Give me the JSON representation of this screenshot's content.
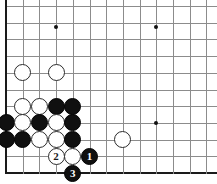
{
  "diagram": {
    "board_size": 19,
    "visible_region": "top-left corner",
    "grid": {
      "origin_x": 6,
      "origin_y": 6,
      "spacing": 16.7,
      "cols_visible": 13,
      "rows_visible": 11,
      "line_color": "#8c8c8c",
      "edge_color": "#1a1a1a",
      "background_color": "#ffffff"
    },
    "star_points": [
      {
        "name": "hoshi-top-left",
        "col": 3,
        "row": 1.25
      },
      {
        "name": "hoshi-top-right",
        "col": 9,
        "row": 1.25
      },
      {
        "name": "hoshi-center-right",
        "col": 9,
        "row": 7
      }
    ],
    "stones": [
      {
        "name": "white-stone-1",
        "color": "white",
        "col": 1,
        "row": 4,
        "label": ""
      },
      {
        "name": "white-stone-2",
        "color": "white",
        "col": 3,
        "row": 4,
        "label": ""
      },
      {
        "name": "white-stone-3",
        "color": "white",
        "col": 1,
        "row": 6,
        "label": ""
      },
      {
        "name": "white-stone-4",
        "color": "white",
        "col": 2,
        "row": 6,
        "label": ""
      },
      {
        "name": "black-stone-1",
        "color": "black",
        "col": 3,
        "row": 6,
        "label": ""
      },
      {
        "name": "black-stone-2",
        "color": "black",
        "col": 4,
        "row": 6,
        "label": ""
      },
      {
        "name": "black-stone-3",
        "color": "black",
        "col": 0,
        "row": 7,
        "label": ""
      },
      {
        "name": "white-stone-5",
        "color": "white",
        "col": 1,
        "row": 7,
        "label": ""
      },
      {
        "name": "black-stone-4",
        "color": "black",
        "col": 2,
        "row": 7,
        "label": ""
      },
      {
        "name": "white-stone-6",
        "color": "white",
        "col": 3,
        "row": 7,
        "label": ""
      },
      {
        "name": "black-stone-5",
        "color": "black",
        "col": 4,
        "row": 7,
        "label": ""
      },
      {
        "name": "black-stone-6",
        "color": "black",
        "col": 0,
        "row": 8,
        "label": ""
      },
      {
        "name": "black-stone-7",
        "color": "black",
        "col": 1,
        "row": 8,
        "label": ""
      },
      {
        "name": "white-stone-7",
        "color": "white",
        "col": 2,
        "row": 8,
        "label": ""
      },
      {
        "name": "white-stone-8",
        "color": "white",
        "col": 3,
        "row": 8,
        "label": ""
      },
      {
        "name": "black-stone-8",
        "color": "black",
        "col": 4,
        "row": 8,
        "label": ""
      },
      {
        "name": "white-stone-9",
        "color": "white",
        "col": 7,
        "row": 8,
        "label": ""
      },
      {
        "name": "move-2-white-stone",
        "color": "white",
        "col": 3,
        "row": 9,
        "label": "2"
      },
      {
        "name": "white-stone-10",
        "color": "white",
        "col": 4,
        "row": 9,
        "label": ""
      },
      {
        "name": "move-1-black-stone",
        "color": "black",
        "col": 5,
        "row": 9,
        "label": "1"
      },
      {
        "name": "move-3-black-stone",
        "color": "black",
        "col": 4,
        "row": 10,
        "label": "3"
      }
    ],
    "move_sequence": [
      {
        "number": "1",
        "color": "black"
      },
      {
        "number": "2",
        "color": "white"
      },
      {
        "number": "3",
        "color": "black"
      }
    ]
  }
}
